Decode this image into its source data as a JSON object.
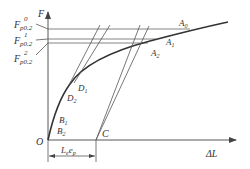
{
  "diagram": {
    "type": "force-elongation curve with offset-line proof strength construction",
    "axes": {
      "y_label": "F",
      "x_label": "ΔL",
      "origin_label": "O"
    },
    "y_labels": [
      {
        "main": "F",
        "sub": "p0.2",
        "sup": "0"
      },
      {
        "main": "F",
        "sub": "p0.2",
        "sup": "1"
      },
      {
        "main": "F",
        "sub": "p0.2",
        "sup": "2"
      }
    ],
    "points": {
      "A0": {
        "main": "A",
        "sub": "0"
      },
      "A1": {
        "main": "A",
        "sub": "1"
      },
      "A2": {
        "main": "A",
        "sub": "2"
      },
      "D1": {
        "main": "D",
        "sub": "1"
      },
      "D2": {
        "main": "D",
        "sub": "2"
      },
      "B1": {
        "main": "B",
        "sub": "1"
      },
      "B2": {
        "main": "B",
        "sub": "2"
      },
      "C": {
        "main": "C"
      }
    },
    "dimension": {
      "main1": "L",
      "sub1": "e",
      "main2": "e",
      "sub2": "p"
    },
    "colors": {
      "line": "#333333",
      "background": "#ffffff"
    }
  }
}
